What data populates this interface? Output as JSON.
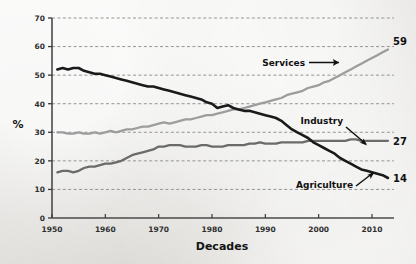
{
  "chart_data": {
    "type": "line",
    "title": "",
    "xlabel": "Decades",
    "ylabel": "%",
    "xlim": [
      1950,
      2013
    ],
    "ylim": [
      0,
      70
    ],
    "grid": true,
    "legend_position": "inline-annotations",
    "xticks": [
      1950,
      1960,
      1970,
      1980,
      1990,
      2000,
      2010
    ],
    "xtick_labels": [
      "1950",
      "1960",
      "1970",
      "1980",
      "1990",
      "2000",
      "2010"
    ],
    "yticks": [
      0,
      10,
      20,
      30,
      40,
      50,
      60,
      70
    ],
    "ytick_labels": [
      "0",
      "10",
      "20",
      "30",
      "40",
      "50",
      "60",
      "70"
    ],
    "series": [
      {
        "name": "Services",
        "color": "#9d9d9d",
        "end_label": "59",
        "annotation": "Services",
        "x": [
          1951,
          1952,
          1953,
          1954,
          1955,
          1956,
          1957,
          1958,
          1959,
          1960,
          1961,
          1962,
          1963,
          1964,
          1965,
          1966,
          1967,
          1968,
          1969,
          1970,
          1971,
          1972,
          1973,
          1974,
          1975,
          1976,
          1977,
          1978,
          1979,
          1980,
          1981,
          1982,
          1983,
          1984,
          1985,
          1986,
          1987,
          1988,
          1989,
          1990,
          1991,
          1992,
          1993,
          1994,
          1995,
          1996,
          1997,
          1998,
          1999,
          2000,
          2001,
          2002,
          2003,
          2004,
          2005,
          2006,
          2007,
          2008,
          2009,
          2010,
          2011,
          2012,
          2013
        ],
        "values": [
          30,
          30,
          29.5,
          29.5,
          30,
          29.5,
          29.5,
          30,
          29.5,
          30,
          30.5,
          30,
          30.5,
          31,
          31,
          31.5,
          32,
          32,
          32.5,
          33,
          33.5,
          33,
          33.5,
          34,
          34.5,
          34.5,
          35,
          35.5,
          36,
          36,
          36.5,
          37,
          37.5,
          38,
          38,
          38.5,
          39,
          39.5,
          40,
          40.5,
          41,
          41.5,
          42,
          43,
          43.5,
          44,
          44.5,
          45.5,
          46,
          46.5,
          47.5,
          48,
          49,
          50,
          51,
          52,
          53,
          54,
          55,
          56,
          57,
          58,
          59
        ]
      },
      {
        "name": "Industry",
        "color": "#6b6b6b",
        "end_label": "27",
        "annotation": "Industry",
        "x": [
          1951,
          1952,
          1953,
          1954,
          1955,
          1956,
          1957,
          1958,
          1959,
          1960,
          1961,
          1962,
          1963,
          1964,
          1965,
          1966,
          1967,
          1968,
          1969,
          1970,
          1971,
          1972,
          1973,
          1974,
          1975,
          1976,
          1977,
          1978,
          1979,
          1980,
          1981,
          1982,
          1983,
          1984,
          1985,
          1986,
          1987,
          1988,
          1989,
          1990,
          1991,
          1992,
          1993,
          1994,
          1995,
          1996,
          1997,
          1998,
          1999,
          2000,
          2001,
          2002,
          2003,
          2004,
          2005,
          2006,
          2007,
          2008,
          2009,
          2010,
          2011,
          2012,
          2013
        ],
        "values": [
          16,
          16.5,
          16.5,
          16,
          16.5,
          17.5,
          18,
          18,
          18.5,
          19,
          19,
          19.5,
          20,
          21,
          22,
          22.5,
          23,
          23.5,
          24,
          25,
          25,
          25.5,
          25.5,
          25.5,
          25,
          25,
          25,
          25.5,
          25.5,
          25,
          25,
          25,
          25.5,
          25.5,
          25.5,
          25.5,
          26,
          26,
          26.5,
          26,
          26,
          26,
          26.5,
          26.5,
          26.5,
          26.5,
          26.5,
          27,
          27,
          27,
          27,
          27,
          27,
          27,
          27,
          27.5,
          27.5,
          27,
          27,
          27,
          27,
          27,
          27
        ]
      },
      {
        "name": "Agriculture",
        "color": "#1a1a1a",
        "end_label": "14",
        "annotation": "Agriculture",
        "x": [
          1951,
          1952,
          1953,
          1954,
          1955,
          1956,
          1957,
          1958,
          1959,
          1960,
          1961,
          1962,
          1963,
          1964,
          1965,
          1966,
          1967,
          1968,
          1969,
          1970,
          1971,
          1972,
          1973,
          1974,
          1975,
          1976,
          1977,
          1978,
          1979,
          1980,
          1981,
          1982,
          1983,
          1984,
          1985,
          1986,
          1987,
          1988,
          1989,
          1990,
          1991,
          1992,
          1993,
          1994,
          1995,
          1996,
          1997,
          1998,
          1999,
          2000,
          2001,
          2002,
          2003,
          2004,
          2005,
          2006,
          2007,
          2008,
          2009,
          2010,
          2011,
          2012,
          2013
        ],
        "values": [
          52,
          52.5,
          52,
          52.5,
          52.5,
          51.5,
          51,
          50.5,
          50.5,
          50,
          49.5,
          49,
          48.5,
          48,
          47.5,
          47,
          46.5,
          46,
          46,
          45.5,
          45,
          44.5,
          44,
          43.5,
          43,
          42.5,
          42,
          41.5,
          40.5,
          40,
          38.5,
          39,
          39.5,
          38.5,
          38,
          37.5,
          37.5,
          37,
          36.5,
          36,
          35.5,
          35,
          34,
          32.5,
          31,
          30,
          29,
          28,
          26.5,
          25.5,
          24.5,
          23.5,
          22.5,
          21,
          20,
          19,
          18,
          17,
          16.5,
          16,
          15.5,
          15,
          14
        ]
      }
    ]
  },
  "axes": {
    "ylabel": "%",
    "xlabel": "Decades"
  }
}
